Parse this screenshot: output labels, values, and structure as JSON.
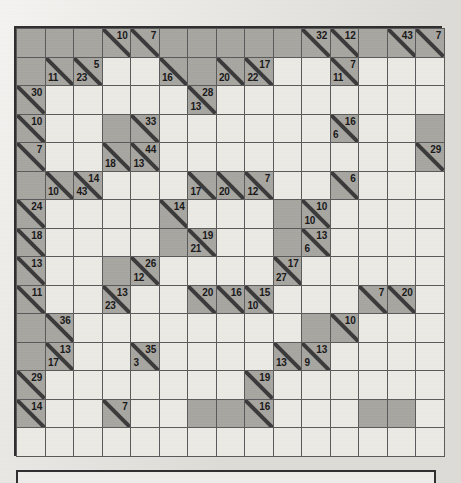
{
  "puzzle": {
    "type": "kakuro",
    "rows": 15,
    "cols": 15,
    "colors": {
      "open_cell": "#eceae5",
      "block_cell": "#a8a6a1",
      "grid_line": "#5a5a5a",
      "border": "#2f2f2f",
      "page_background": "#e8e6e1",
      "clue_text": "#181818"
    },
    "legend": {
      "down_clue_position": "upper-right",
      "across_clue_position": "lower-left"
    },
    "cells": [
      [
        {
          "t": "block"
        },
        {
          "t": "block"
        },
        {
          "t": "block"
        },
        {
          "t": "clue",
          "down": "10"
        },
        {
          "t": "clue",
          "down": "7"
        },
        {
          "t": "block"
        },
        {
          "t": "block"
        },
        {
          "t": "block"
        },
        {
          "t": "block"
        },
        {
          "t": "block"
        },
        {
          "t": "clue",
          "down": "32"
        },
        {
          "t": "clue",
          "down": "12"
        },
        {
          "t": "block"
        },
        {
          "t": "clue",
          "down": "43"
        },
        {
          "t": "clue",
          "down": "7"
        }
      ],
      [
        {
          "t": "block"
        },
        {
          "t": "clue",
          "across": "11"
        },
        {
          "t": "clue",
          "across": "23",
          "down": "5"
        },
        {
          "t": "open"
        },
        {
          "t": "open"
        },
        {
          "t": "clue",
          "across": "16"
        },
        {
          "t": "block"
        },
        {
          "t": "clue",
          "across": "20"
        },
        {
          "t": "clue",
          "across": "22",
          "down": "17"
        },
        {
          "t": "open"
        },
        {
          "t": "open"
        },
        {
          "t": "clue",
          "across": "11",
          "down": "7"
        },
        {
          "t": "open"
        },
        {
          "t": "open"
        },
        {
          "t": "open"
        }
      ],
      [
        {
          "t": "clue",
          "down": "30"
        },
        {
          "t": "open"
        },
        {
          "t": "open"
        },
        {
          "t": "open"
        },
        {
          "t": "open"
        },
        {
          "t": "open"
        },
        {
          "t": "clue",
          "across": "13",
          "down": "28"
        },
        {
          "t": "open"
        },
        {
          "t": "open"
        },
        {
          "t": "open"
        },
        {
          "t": "open"
        },
        {
          "t": "open"
        },
        {
          "t": "open"
        },
        {
          "t": "open"
        },
        {
          "t": "open"
        }
      ],
      [
        {
          "t": "clue",
          "down": "10"
        },
        {
          "t": "open"
        },
        {
          "t": "open"
        },
        {
          "t": "block"
        },
        {
          "t": "clue",
          "down": "33"
        },
        {
          "t": "open"
        },
        {
          "t": "open"
        },
        {
          "t": "open"
        },
        {
          "t": "open"
        },
        {
          "t": "open"
        },
        {
          "t": "open"
        },
        {
          "t": "clue",
          "across": "6",
          "down": "16"
        },
        {
          "t": "open"
        },
        {
          "t": "open"
        },
        {
          "t": "block"
        }
      ],
      [
        {
          "t": "clue",
          "down": "7"
        },
        {
          "t": "open"
        },
        {
          "t": "open"
        },
        {
          "t": "clue",
          "across": "18"
        },
        {
          "t": "clue",
          "across": "13",
          "down": "44"
        },
        {
          "t": "open"
        },
        {
          "t": "open"
        },
        {
          "t": "open"
        },
        {
          "t": "open"
        },
        {
          "t": "open"
        },
        {
          "t": "open"
        },
        {
          "t": "open"
        },
        {
          "t": "open"
        },
        {
          "t": "open"
        },
        {
          "t": "clue",
          "down": "29"
        }
      ],
      [
        {
          "t": "block"
        },
        {
          "t": "clue",
          "across": "10"
        },
        {
          "t": "clue",
          "across": "43",
          "down": "14"
        },
        {
          "t": "open"
        },
        {
          "t": "open"
        },
        {
          "t": "open"
        },
        {
          "t": "clue",
          "across": "17"
        },
        {
          "t": "clue",
          "across": "20"
        },
        {
          "t": "clue",
          "across": "12",
          "down": "7"
        },
        {
          "t": "open"
        },
        {
          "t": "open"
        },
        {
          "t": "clue",
          "down": "6"
        },
        {
          "t": "open"
        },
        {
          "t": "open"
        },
        {
          "t": "open"
        }
      ],
      [
        {
          "t": "clue",
          "down": "24"
        },
        {
          "t": "open"
        },
        {
          "t": "open"
        },
        {
          "t": "open"
        },
        {
          "t": "open"
        },
        {
          "t": "clue",
          "down": "14"
        },
        {
          "t": "open"
        },
        {
          "t": "open"
        },
        {
          "t": "open"
        },
        {
          "t": "block"
        },
        {
          "t": "clue",
          "across": "10",
          "down": "10"
        },
        {
          "t": "open"
        },
        {
          "t": "open"
        },
        {
          "t": "open"
        },
        {
          "t": "open"
        }
      ],
      [
        {
          "t": "clue",
          "down": "18"
        },
        {
          "t": "open"
        },
        {
          "t": "open"
        },
        {
          "t": "open"
        },
        {
          "t": "open"
        },
        {
          "t": "block"
        },
        {
          "t": "clue",
          "across": "21",
          "down": "19"
        },
        {
          "t": "open"
        },
        {
          "t": "open"
        },
        {
          "t": "block"
        },
        {
          "t": "clue",
          "across": "6",
          "down": "13"
        },
        {
          "t": "open"
        },
        {
          "t": "open"
        },
        {
          "t": "open"
        },
        {
          "t": "open"
        }
      ],
      [
        {
          "t": "clue",
          "down": "13"
        },
        {
          "t": "open"
        },
        {
          "t": "open"
        },
        {
          "t": "block"
        },
        {
          "t": "clue",
          "across": "12",
          "down": "26"
        },
        {
          "t": "open"
        },
        {
          "t": "open"
        },
        {
          "t": "open"
        },
        {
          "t": "open"
        },
        {
          "t": "clue",
          "across": "27",
          "down": "17"
        },
        {
          "t": "open"
        },
        {
          "t": "open"
        },
        {
          "t": "open"
        },
        {
          "t": "open"
        },
        {
          "t": "open"
        }
      ],
      [
        {
          "t": "clue",
          "down": "11"
        },
        {
          "t": "open"
        },
        {
          "t": "open"
        },
        {
          "t": "clue",
          "across": "23",
          "down": "13"
        },
        {
          "t": "open"
        },
        {
          "t": "open"
        },
        {
          "t": "clue",
          "down": "20"
        },
        {
          "t": "clue",
          "down": "16"
        },
        {
          "t": "clue",
          "across": "10",
          "down": "15"
        },
        {
          "t": "open"
        },
        {
          "t": "open"
        },
        {
          "t": "open"
        },
        {
          "t": "clue",
          "down": "7"
        },
        {
          "t": "clue",
          "down": "20"
        },
        {
          "t": "open"
        }
      ],
      [
        {
          "t": "block"
        },
        {
          "t": "clue",
          "down": "36"
        },
        {
          "t": "open"
        },
        {
          "t": "open"
        },
        {
          "t": "open"
        },
        {
          "t": "open"
        },
        {
          "t": "open"
        },
        {
          "t": "open"
        },
        {
          "t": "open"
        },
        {
          "t": "open"
        },
        {
          "t": "block"
        },
        {
          "t": "clue",
          "down": "10"
        },
        {
          "t": "open"
        },
        {
          "t": "open"
        },
        {
          "t": "open"
        }
      ],
      [
        {
          "t": "block"
        },
        {
          "t": "clue",
          "across": "17",
          "down": "13"
        },
        {
          "t": "open"
        },
        {
          "t": "open"
        },
        {
          "t": "clue",
          "across": "3",
          "down": "35"
        },
        {
          "t": "open"
        },
        {
          "t": "open"
        },
        {
          "t": "open"
        },
        {
          "t": "open"
        },
        {
          "t": "clue",
          "across": "13"
        },
        {
          "t": "clue",
          "across": "9",
          "down": "13"
        },
        {
          "t": "open"
        },
        {
          "t": "open"
        },
        {
          "t": "open"
        },
        {
          "t": "open"
        }
      ],
      [
        {
          "t": "clue",
          "down": "29"
        },
        {
          "t": "open"
        },
        {
          "t": "open"
        },
        {
          "t": "open"
        },
        {
          "t": "open"
        },
        {
          "t": "open"
        },
        {
          "t": "open"
        },
        {
          "t": "open"
        },
        {
          "t": "clue",
          "down": "19"
        },
        {
          "t": "open"
        },
        {
          "t": "open"
        },
        {
          "t": "open"
        },
        {
          "t": "open"
        },
        {
          "t": "open"
        },
        {
          "t": "open"
        }
      ],
      [
        {
          "t": "clue",
          "down": "14"
        },
        {
          "t": "open"
        },
        {
          "t": "open"
        },
        {
          "t": "clue",
          "down": "7"
        },
        {
          "t": "open"
        },
        {
          "t": "open"
        },
        {
          "t": "block"
        },
        {
          "t": "block"
        },
        {
          "t": "clue",
          "down": "16"
        },
        {
          "t": "open"
        },
        {
          "t": "open"
        },
        {
          "t": "open"
        },
        {
          "t": "block"
        },
        {
          "t": "block"
        },
        {
          "t": "open"
        }
      ],
      [
        {
          "t": "pad"
        },
        {
          "t": "pad"
        },
        {
          "t": "pad"
        },
        {
          "t": "pad"
        },
        {
          "t": "pad"
        },
        {
          "t": "pad"
        },
        {
          "t": "pad"
        },
        {
          "t": "pad"
        },
        {
          "t": "pad"
        },
        {
          "t": "pad"
        },
        {
          "t": "pad"
        },
        {
          "t": "pad"
        },
        {
          "t": "pad"
        },
        {
          "t": "pad"
        },
        {
          "t": "pad"
        }
      ]
    ]
  }
}
